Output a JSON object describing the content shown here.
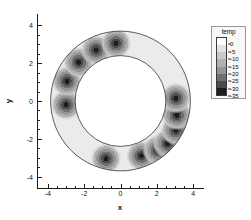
{
  "chart_data": {
    "type": "heatmap",
    "render": "filled-contour",
    "title": "",
    "xlabel": "x",
    "ylabel": "y",
    "xlim": [
      -4.6,
      4.6
    ],
    "xlim_ticks": [
      -4,
      -2,
      0,
      2,
      4
    ],
    "ylim": [
      -4.6,
      4.6
    ],
    "ylim_ticks": [
      4,
      2,
      0,
      -2,
      -4
    ],
    "xtick_labels": [
      "-4",
      "-2",
      "0",
      "2",
      "4"
    ],
    "ytick_labels": [
      "4",
      "2",
      "0",
      "-2",
      "-4"
    ],
    "minor_ticks_per_interval": 4,
    "grid": false,
    "domain": {
      "shape": "annulus",
      "center": [
        0,
        0
      ],
      "outer_radius": 3.85,
      "inner_radius": 2.5,
      "outline_color": "#333333"
    },
    "colorbar": {
      "title": "temp",
      "position": "right",
      "orientation": "vertical",
      "levels": [
        0,
        -5,
        -10,
        -15,
        -20,
        -25,
        -30,
        -35
      ],
      "tick_labels": [
        "0",
        "-5",
        "-10",
        "-15",
        "-20",
        "-25",
        "-30",
        "-35"
      ],
      "vmin": -35,
      "vmax": 0,
      "colors": [
        "#ffffff",
        "#e2e2e2",
        "#c9c9c9",
        "#b0b0b0",
        "#949494",
        "#6f6f6f",
        "#4a4a4a",
        "#1c1c1c"
      ]
    },
    "background_value": 0,
    "annulus_base_value": -4,
    "spot_peak_value": -35,
    "spot_radius": 0.55,
    "spots": [
      {
        "x": -3.0,
        "y": -0.2,
        "value": -33
      },
      {
        "x": -2.95,
        "y": 1.05,
        "value": -34
      },
      {
        "x": -2.3,
        "y": 2.05,
        "value": -33
      },
      {
        "x": -1.35,
        "y": 2.7,
        "value": -32
      },
      {
        "x": -0.25,
        "y": 3.05,
        "value": -33
      },
      {
        "x": -0.8,
        "y": -3.05,
        "value": -33
      },
      {
        "x": 1.15,
        "y": -2.9,
        "value": -34
      },
      {
        "x": 2.05,
        "y": -2.6,
        "value": -32
      },
      {
        "x": 2.6,
        "y": -2.25,
        "value": -31
      },
      {
        "x": 3.05,
        "y": -1.55,
        "value": -33
      },
      {
        "x": 3.1,
        "y": -0.75,
        "value": -32
      },
      {
        "x": 3.05,
        "y": 0.15,
        "value": -34
      }
    ]
  },
  "axes": {
    "xlabel": "x",
    "ylabel": "y",
    "xticks": [
      {
        "value": -4,
        "label": "-4"
      },
      {
        "value": -2,
        "label": "-2"
      },
      {
        "value": 0,
        "label": "0"
      },
      {
        "value": 2,
        "label": "2"
      },
      {
        "value": 4,
        "label": "4"
      }
    ],
    "yticks": [
      {
        "value": 4,
        "label": "4"
      },
      {
        "value": 2,
        "label": "2"
      },
      {
        "value": 0,
        "label": "0"
      },
      {
        "value": -2,
        "label": "-2"
      },
      {
        "value": -4,
        "label": "-4"
      }
    ]
  },
  "legend": {
    "title": "temp",
    "entries": [
      {
        "label": "0",
        "color": "#ffffff"
      },
      {
        "label": "-5",
        "color": "#e2e2e2"
      },
      {
        "label": "-10",
        "color": "#c9c9c9"
      },
      {
        "label": "-15",
        "color": "#b0b0b0"
      },
      {
        "label": "-20",
        "color": "#949494"
      },
      {
        "label": "-25",
        "color": "#6f6f6f"
      },
      {
        "label": "-30",
        "color": "#4a4a4a"
      },
      {
        "label": "-35",
        "color": "#1c1c1c"
      }
    ]
  }
}
